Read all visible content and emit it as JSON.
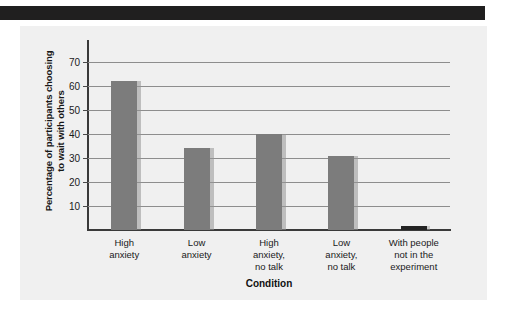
{
  "page": {
    "header_band": "decorative-dark-band"
  },
  "chart_data": {
    "type": "bar",
    "title": "",
    "xlabel": "Condition",
    "ylabel": "Percentage of participants choosing to wait with others",
    "ylabel_line1": "Percentage of participants choosing",
    "ylabel_line2": "to wait with others",
    "categories": [
      "High anxiety",
      "Low anxiety",
      "High anxiety, no talk",
      "Low anxiety, no talk",
      "With people not in the experiment"
    ],
    "category_lines": [
      [
        "High",
        "anxiety"
      ],
      [
        "Low",
        "anxiety"
      ],
      [
        "High",
        "anxiety,",
        "no talk"
      ],
      [
        "Low",
        "anxiety,",
        "no talk"
      ],
      [
        "With people",
        "not in the",
        "experiment"
      ]
    ],
    "values": [
      62,
      34,
      40,
      31,
      1
    ],
    "ylim": [
      0,
      75
    ],
    "yticks": [
      10,
      20,
      30,
      40,
      50,
      60,
      70
    ],
    "ytick_labels": [
      "10",
      "20",
      "30",
      "40",
      "50",
      "60",
      "70"
    ],
    "grid": true,
    "legend": "none",
    "bar_color": "#7c7c7c",
    "last_bar_color": "#232323",
    "panel_color": "#f0f0f0",
    "gridline_color": "#8d8d8d",
    "axis_color": "#3a3a3a"
  }
}
